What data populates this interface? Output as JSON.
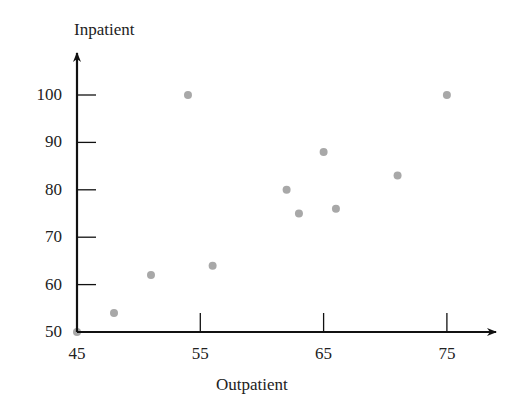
{
  "chart_data": {
    "type": "scatter",
    "title": "",
    "xlabel": "Outpatient",
    "ylabel": "Inpatient",
    "xlim": [
      45,
      78
    ],
    "ylim": [
      50,
      108
    ],
    "xticks": [
      45,
      55,
      65,
      75
    ],
    "yticks": [
      50,
      60,
      70,
      80,
      90,
      100
    ],
    "xtick_labels": [
      "45",
      "55",
      "65",
      "75"
    ],
    "ytick_labels": [
      "50",
      "60",
      "70",
      "80",
      "90",
      "100"
    ],
    "grid": false,
    "legend": null,
    "marker_color": "#a8a8a8",
    "axis_color": "#111111",
    "points": [
      {
        "x": 45,
        "y": 50
      },
      {
        "x": 48,
        "y": 54
      },
      {
        "x": 51,
        "y": 62
      },
      {
        "x": 54,
        "y": 100
      },
      {
        "x": 56,
        "y": 64
      },
      {
        "x": 62,
        "y": 80
      },
      {
        "x": 63,
        "y": 75
      },
      {
        "x": 65,
        "y": 88
      },
      {
        "x": 66,
        "y": 76
      },
      {
        "x": 71,
        "y": 83
      },
      {
        "x": 75,
        "y": 100
      }
    ],
    "x": [
      45,
      48,
      51,
      54,
      56,
      62,
      63,
      65,
      66,
      71,
      75
    ],
    "y": [
      50,
      54,
      62,
      100,
      64,
      80,
      75,
      88,
      76,
      83,
      100
    ]
  },
  "labels": {
    "x_axis_title": "Outpatient",
    "y_axis_title": "Inpatient"
  }
}
